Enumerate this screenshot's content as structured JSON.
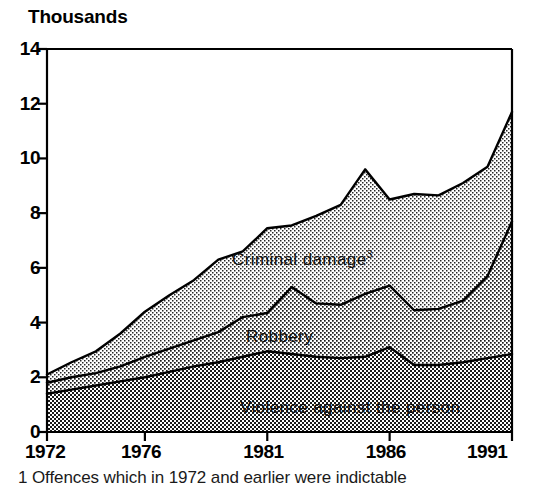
{
  "chart_data": {
    "type": "area",
    "title": "",
    "subtitle": "",
    "xlabel": "",
    "ylabel": "Thousands",
    "stacked": true,
    "grid": false,
    "legend_position": "inline-on-bands",
    "x": [
      1972,
      1973,
      1974,
      1975,
      1976,
      1977,
      1978,
      1979,
      1980,
      1981,
      1982,
      1983,
      1984,
      1985,
      1986,
      1987,
      1988,
      1989,
      1990,
      1991
    ],
    "xlim": [
      1972,
      1991
    ],
    "ylim": [
      0,
      14
    ],
    "xticks": [
      1972,
      1976,
      1981,
      1986,
      1991
    ],
    "xtick_labels": [
      "1972",
      "1976",
      "1981",
      "1986",
      "1991"
    ],
    "yticks": [
      0,
      2,
      4,
      6,
      8,
      10,
      12,
      14
    ],
    "ytick_labels": [
      "0",
      "2",
      "4",
      "6",
      "8",
      "10",
      "12",
      "14"
    ],
    "series": [
      {
        "name": "Violence against the person",
        "label": "Violence against the person",
        "fill": "#b4b4b4",
        "values": [
          1.4,
          1.55,
          1.7,
          1.85,
          2.0,
          2.2,
          2.4,
          2.55,
          2.75,
          2.95,
          2.85,
          2.75,
          2.7,
          2.75,
          3.1,
          2.45,
          2.45,
          2.55,
          2.7,
          2.85
        ]
      },
      {
        "name": "Robbery",
        "label": "Robbery",
        "fill": "#c8c8c8",
        "values": [
          0.4,
          0.45,
          0.45,
          0.55,
          0.75,
          0.85,
          0.95,
          1.1,
          1.45,
          1.4,
          2.45,
          1.95,
          1.95,
          2.3,
          2.25,
          2.0,
          2.05,
          2.25,
          3.0,
          4.85
        ]
      },
      {
        "name": "Criminal damage",
        "label": "Criminal damage",
        "footnote_marker": "3",
        "fill": "#d7d7d7",
        "values": [
          0.3,
          0.55,
          0.8,
          1.2,
          1.65,
          1.95,
          2.2,
          2.65,
          2.4,
          3.1,
          2.25,
          3.2,
          3.65,
          4.55,
          3.15,
          4.25,
          4.15,
          4.3,
          4.0,
          4.0
        ]
      }
    ],
    "cumulative_totals": [
      2.1,
      2.55,
      2.95,
      3.6,
      4.4,
      5.0,
      5.55,
      6.3,
      6.6,
      7.45,
      7.55,
      7.9,
      8.3,
      9.6,
      8.5,
      8.7,
      8.65,
      9.1,
      9.7,
      11.7
    ],
    "annotations": [
      {
        "text": "Thousands",
        "role": "y-axis-unit"
      }
    ]
  },
  "footnote": {
    "text": "1 Offences which in 1972 and earlier were indictable"
  },
  "labels": {
    "criminal_damage": "Criminal damage",
    "criminal_damage_marker": "3",
    "robbery": "Robbery",
    "violence": "Violence against the person"
  }
}
